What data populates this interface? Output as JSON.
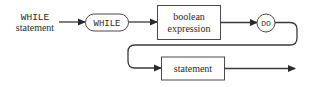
{
  "diagram": {
    "title_label": {
      "keyword": "WHILE",
      "word": "statement"
    },
    "nodes": [
      {
        "id": "while",
        "type": "terminal-pill",
        "text": "WHILE"
      },
      {
        "id": "condition",
        "type": "nonterminal-box",
        "lines": [
          "boolean",
          "expression"
        ]
      },
      {
        "id": "do",
        "type": "terminal-circle",
        "text": "DO"
      },
      {
        "id": "body",
        "type": "nonterminal-box",
        "text": "statement"
      }
    ],
    "edges": [
      {
        "from": "label",
        "to": "while"
      },
      {
        "from": "while",
        "to": "condition"
      },
      {
        "from": "condition",
        "to": "do"
      },
      {
        "from": "do",
        "to": "body"
      },
      {
        "from": "body",
        "to": "exit"
      }
    ]
  }
}
